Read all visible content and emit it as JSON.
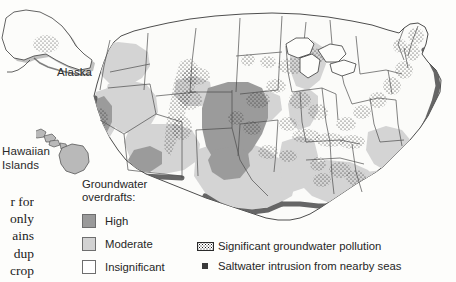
{
  "figure": {
    "background_color": "#fdfdfb"
  },
  "body_text_fragment": {
    "lines": [
      "r for",
      "only",
      "ains",
      "dup",
      "crop"
    ]
  },
  "insets": {
    "alaska_label": "Alaska",
    "hawaii_label_line1": "Hawaiian",
    "hawaii_label_line2": "Islands"
  },
  "legend": {
    "overdrafts": {
      "title_line1": "Groundwater",
      "title_line2": "overdrafts:",
      "items": [
        {
          "label": "High",
          "color": "#9a9a9a",
          "border": "#6e6e6e"
        },
        {
          "label": "Moderate",
          "color": "#d2d2d2",
          "border": "#6e6e6e"
        },
        {
          "label": "Insignificant",
          "color": "#ffffff",
          "border": "#6e6e6e"
        }
      ]
    },
    "symbols": [
      {
        "icon": "stipple-pattern-icon",
        "label": "Significant groundwater pollution"
      },
      {
        "icon": "filled-square-icon",
        "label": "Saltwater intrusion from nearby seas"
      }
    ]
  },
  "map_data": {
    "type": "choropleth-thematic-map",
    "region": "United States (with Alaska and Hawaii insets)",
    "classes": [
      "High",
      "Moderate",
      "Insignificant"
    ],
    "class_colors": {
      "High": "#9a9a9a",
      "Moderate": "#d2d2d2",
      "Insignificant": "#ffffff"
    },
    "overlay_symbols": {
      "significant_groundwater_pollution": "stipple dots scattered across affected areas",
      "saltwater_intrusion": "dark band along Pacific, Gulf and Atlantic coastlines"
    },
    "high_overdraft_areas": [
      "High Plains / Ogallala Aquifer (Nebraska, Kansas, Oklahoma panhandle, Texas panhandle, eastern Colorado, eastern New Mexico)",
      "Central Valley, California",
      "Southern Arizona"
    ],
    "moderate_overdraft_areas": [
      "Pacific Northwest interior (eastern Washington, Oregon, Idaho)",
      "Nevada and Utah basins",
      "Arizona and New Mexico",
      "Lower Mississippi Valley (Arkansas, Louisiana, Mississippi)",
      "Gulf Coastal Plain (Texas, Louisiana, Alabama, Florida)",
      "Southeast Atlantic Coastal Plain",
      "Michigan / Great Lakes lowlands",
      "Hawaiian Islands"
    ],
    "insignificant_overdraft_areas": [
      "Northern Rockies (Montana, Wyoming, Dakotas)",
      "Upper Midwest (Minnesota, Wisconsin, Iowa)",
      "Ohio Valley and Appalachians",
      "Northeast and New England",
      "Alaska"
    ],
    "pollution_concentrations": [
      "Southern California",
      "Colorado Front Range",
      "Upper Midwest / Great Lakes",
      "Ohio Valley",
      "Northeast corridor",
      "Florida",
      "Tennessee Valley"
    ]
  }
}
